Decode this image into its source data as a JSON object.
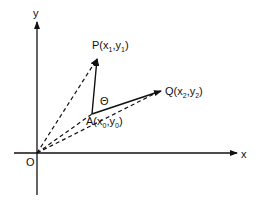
{
  "diagram": {
    "axes": {
      "x_label": "x",
      "y_label": "y",
      "origin_label": "O"
    },
    "points": {
      "P": {
        "name": "P",
        "x_sub": "1",
        "y_sub": "1"
      },
      "A": {
        "name": "A",
        "x_sub": "0",
        "y_sub": "0"
      },
      "Q": {
        "name": "Q",
        "x_sub": "2",
        "y_sub": "2"
      }
    },
    "angle_label": "Θ",
    "symbols": {
      "x": "x",
      "y": "y",
      "open": "(",
      "comma": ",",
      "close": ")"
    },
    "colors": {
      "line": "#111111",
      "background": "#ffffff"
    }
  }
}
